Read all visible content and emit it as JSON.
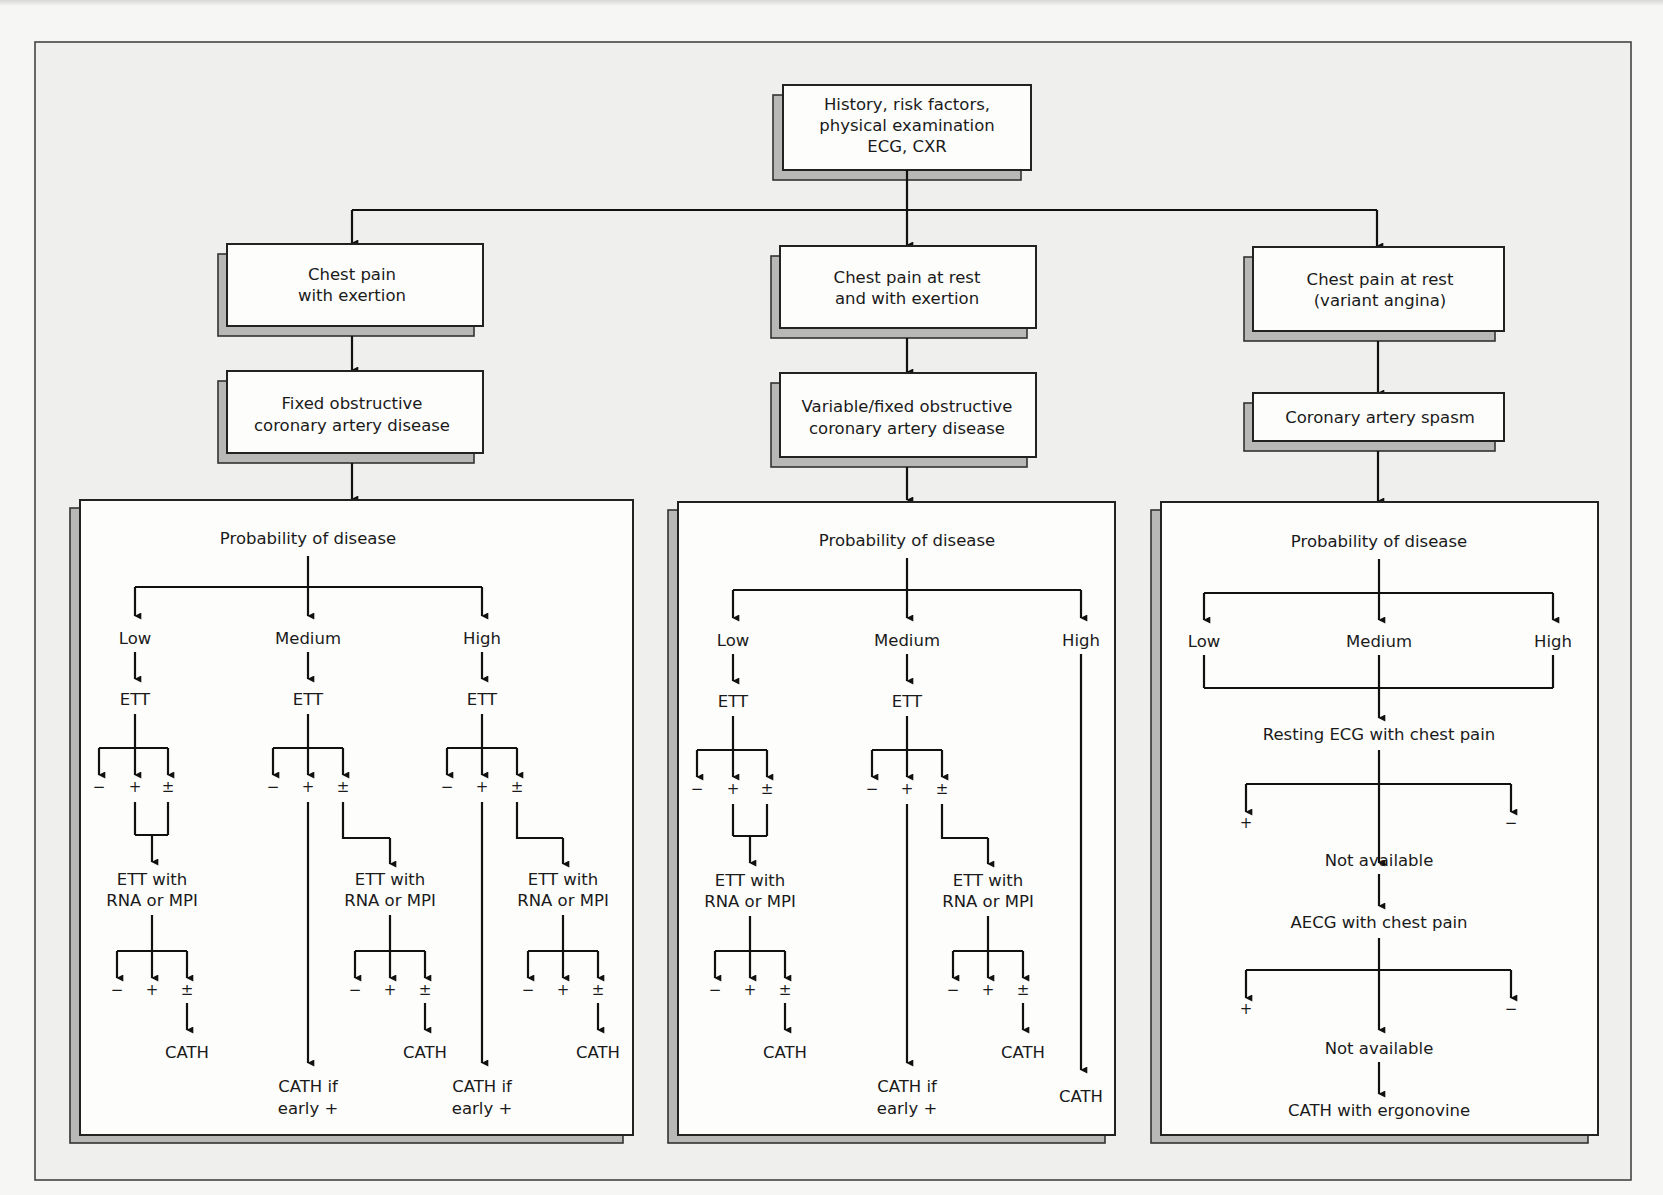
{
  "diagram": {
    "type": "flowchart",
    "root": {
      "lines": [
        "History, risk factors,",
        "physical examination",
        "ECG, CXR"
      ]
    },
    "presentations": [
      {
        "lines": [
          "Chest pain",
          "with exertion"
        ]
      },
      {
        "lines": [
          "Chest pain at rest",
          "and with exertion"
        ]
      },
      {
        "lines": [
          "Chest pain at rest",
          "(variant angina)"
        ]
      }
    ],
    "diagnoses": [
      {
        "lines": [
          "Fixed obstructive",
          "coronary artery disease"
        ]
      },
      {
        "lines": [
          "Variable/fixed obstructive",
          "coronary artery disease"
        ]
      },
      {
        "lines": [
          "Coronary artery spasm"
        ]
      }
    ],
    "panels": [
      {
        "title": "Probability of disease",
        "levels": [
          "Low",
          "Medium",
          "High"
        ],
        "test": "ETT",
        "results": [
          "−",
          "+",
          "±"
        ],
        "ett_with": [
          "ETT with",
          "RNA or MPI"
        ],
        "cath": "CATH",
        "cath_if": [
          "CATH if",
          "early +"
        ]
      },
      {
        "title": "Probability of disease",
        "levels": [
          "Low",
          "Medium",
          "High"
        ],
        "test": "ETT",
        "results": [
          "−",
          "+",
          "±"
        ],
        "ett_with": [
          "ETT with",
          "RNA or MPI"
        ],
        "cath": "CATH",
        "cath_if": [
          "CATH if",
          "early +"
        ]
      },
      {
        "title": "Probability of disease",
        "levels": [
          "Low",
          "Medium",
          "High"
        ],
        "resting_ecg": "Resting ECG with chest pain",
        "results": [
          "+",
          "−"
        ],
        "not_available": "Not available",
        "aecg": "AECG with chest pain",
        "final": "CATH with ergonovine"
      }
    ]
  }
}
